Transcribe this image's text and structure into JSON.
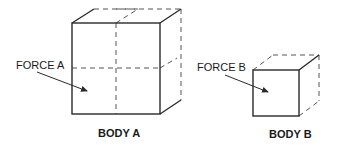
{
  "diagram": {
    "body_a": {
      "force_label": "FORCE A",
      "body_label": "BODY A"
    },
    "body_b": {
      "force_label": "FORCE B",
      "body_label": "BODY B"
    },
    "colors": {
      "line": "#2a2a2a",
      "dashed": "#555555",
      "text": "#1a1a1a"
    }
  }
}
